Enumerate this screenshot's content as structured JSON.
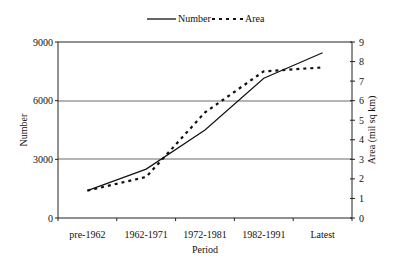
{
  "chart_data": {
    "type": "line",
    "title": "",
    "xlabel": "Period",
    "ylabel": "Number",
    "y2label": "Area (mil sq km)",
    "categories": [
      "pre-1962",
      "1962-1971",
      "1972-1981",
      "1982-1991",
      "Latest"
    ],
    "series": [
      {
        "name": "Number",
        "axis": "left",
        "style": "solid",
        "values": [
          1400,
          2500,
          4500,
          7150,
          8450
        ]
      },
      {
        "name": "Area",
        "axis": "right",
        "style": "dotted",
        "values": [
          1.4,
          2.1,
          5.4,
          7.5,
          7.7
        ]
      }
    ],
    "ylim": [
      0,
      9000
    ],
    "y_ticks": [
      "0",
      "3000",
      "6000",
      "9000"
    ],
    "y2lim": [
      0,
      9
    ],
    "y2_ticks": [
      "0",
      "1",
      "2",
      "3",
      "4",
      "5",
      "6",
      "7",
      "8",
      "9"
    ],
    "grid": "horizontal at 3000 and 6000",
    "legend_position": "top",
    "legend": [
      "Number",
      "Area"
    ]
  }
}
